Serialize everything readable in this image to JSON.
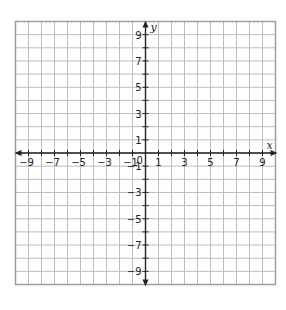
{
  "chart_data": {
    "type": "coordinate-grid",
    "title": "",
    "xlabel": "x",
    "ylabel": "y",
    "xlim": [
      -10,
      10
    ],
    "ylim": [
      -10,
      10
    ],
    "grid": true,
    "grid_step": 1,
    "x_tick_labels": [
      "-9",
      "-7",
      "-5",
      "-3",
      "-1",
      "1",
      "3",
      "5",
      "7",
      "9"
    ],
    "y_tick_labels": [
      "9",
      "7",
      "5",
      "3",
      "1",
      "-1",
      "-3",
      "-5",
      "-7",
      "-9"
    ],
    "origin_label": "0",
    "series": []
  },
  "colors": {
    "grid": "#bdbdbd",
    "border": "#9e9e9e",
    "axis": "#222222"
  },
  "labels": {
    "x_axis": "x",
    "y_axis": "y",
    "origin": "0"
  }
}
